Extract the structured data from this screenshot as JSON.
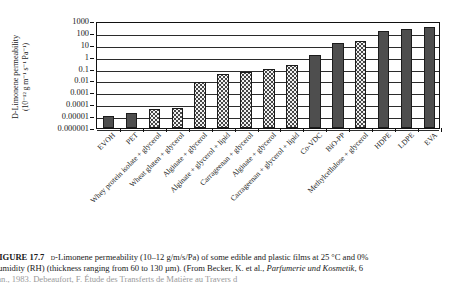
{
  "figure": {
    "number": "FIGURE 17.7",
    "caption_line1_pre": "FIGURE 17.7",
    "caption_line1": "D-Limonene permeability (10–12 g/m/s/Pa) of some edible and plastic films at 25 °C and 0%",
    "caption_line2": "humidity (RH) (thickness ranging from 60 to 130 µm). (From Becker, K. et al., Parfumerie und Kosmetik, 6",
    "caption_line2_italic": "Parfumerie und Kosmetik",
    "caption_line3": "Jan., 1983. Debeaufort, F. Étude des Transferts de Matière au Travers d"
  },
  "axis": {
    "ylabel_line1": "D-Limonene permeability",
    "ylabel_line2": "(10⁻¹² g m⁻¹ s⁻¹ Pa⁻¹)",
    "yticks": [
      "1000",
      "100",
      "10",
      "1",
      "0.1",
      "0.01",
      "0.001",
      "0.0001",
      "0.00001",
      "0.000001"
    ],
    "ytick_values": [
      1000,
      100,
      10,
      1,
      0.1,
      0.01,
      0.001,
      0.0001,
      1e-05,
      1e-06
    ],
    "ymin": 1e-06,
    "ymax": 1000,
    "scale": "log",
    "xlabel": ""
  },
  "style": {
    "edible_fill": "#f2f2f2",
    "plastic_fill": "#4e4e4e",
    "border": "#1c1c1c",
    "gridline": "#2b2b2b"
  },
  "chart_data": {
    "type": "bar",
    "xlabel": "",
    "ylabel": "D-Limonene permeability (10⁻¹² g m⁻¹ s⁻¹ Pa⁻¹)",
    "yscale": "log",
    "ylim": [
      1e-06,
      1000
    ],
    "grid": true,
    "legend": "none",
    "categories": [
      "EVOH",
      "PET",
      "Whey protein isolate + glycerol",
      "Wheat gluten + glycerol",
      "Alginate + glycerol",
      "Alginate + glycerol + lipid",
      "Carrageenan + glycerol",
      "Alginate + glycerol",
      "Carrageenan + glycerol + lipid",
      "Co-VDC",
      "BiO-PP",
      "Methylcellulose + glycerol",
      "HDPE",
      "LDPE",
      "EVA"
    ],
    "values": [
      1e-05,
      2e-05,
      4e-05,
      5e-05,
      0.007,
      0.035,
      0.05,
      0.1,
      0.22,
      1.5,
      13,
      20,
      150,
      230,
      300
    ],
    "series_kinds": [
      "plastic",
      "plastic",
      "edible",
      "edible",
      "edible",
      "edible",
      "edible",
      "edible",
      "edible",
      "plastic",
      "plastic",
      "edible",
      "plastic",
      "plastic",
      "plastic"
    ]
  }
}
